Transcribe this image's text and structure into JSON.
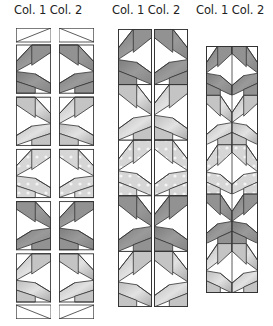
{
  "labels": {
    "group1": "Col. 1 Col. 2",
    "group2": "Col. 1 Col. 2",
    "group3": "Col. 1 Col. 2"
  },
  "groups": [
    {
      "name": "separated-columns",
      "description": "Col. 1 and Col. 2 strips drawn apart with gap"
    },
    {
      "name": "adjacent-columns",
      "description": "Col. 1 and Col. 2 strips placed side by side"
    },
    {
      "name": "joined-columns",
      "description": "Col. 1 and Col. 2 strips sewn together, shorter strip"
    }
  ],
  "bands": [
    "dark",
    "light",
    "dotted",
    "dark",
    "light"
  ],
  "colors": {
    "outline": "#333333",
    "dark": "#8a8a8a",
    "mid": "#b0b0b0",
    "light": "#cfcfcf",
    "dotted": "#d6d6d6",
    "dot": "#f4f4f4",
    "white": "#ffffff"
  }
}
